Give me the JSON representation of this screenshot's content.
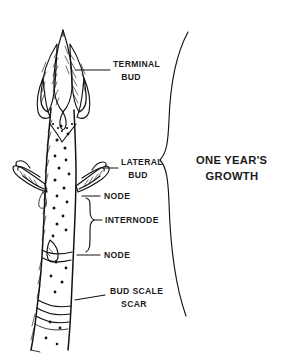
{
  "diagram": {
    "ink_color": "#131313",
    "background_color": "#ffffff",
    "labels": [
      {
        "id": "terminal-bud",
        "line1": "TERMINAL",
        "line2": "BUD"
      },
      {
        "id": "lateral-bud",
        "line1": "LATERAL",
        "line2": "BUD"
      },
      {
        "id": "node-upper",
        "line1": "NODE",
        "line2": ""
      },
      {
        "id": "internode",
        "line1": "INTERNODE",
        "line2": ""
      },
      {
        "id": "node-lower",
        "line1": "NODE",
        "line2": ""
      },
      {
        "id": "bud-scale-scar",
        "line1": "BUD SCALE",
        "line2": "SCAR"
      },
      {
        "id": "one-years-growth",
        "line1": "ONE YEAR'S",
        "line2": "GROWTH"
      }
    ],
    "text": {
      "terminal_bud_l1": "TERMINAL",
      "terminal_bud_l2": "BUD",
      "lateral_bud_l1": "LATERAL",
      "lateral_bud_l2": "BUD",
      "node_upper": "NODE",
      "internode": "INTERNODE",
      "node_lower": "NODE",
      "bud_scale_scar_l1": "BUD SCALE",
      "bud_scale_scar_l2": "SCAR",
      "growth_l1": "ONE YEAR'S",
      "growth_l2": "GROWTH"
    }
  }
}
